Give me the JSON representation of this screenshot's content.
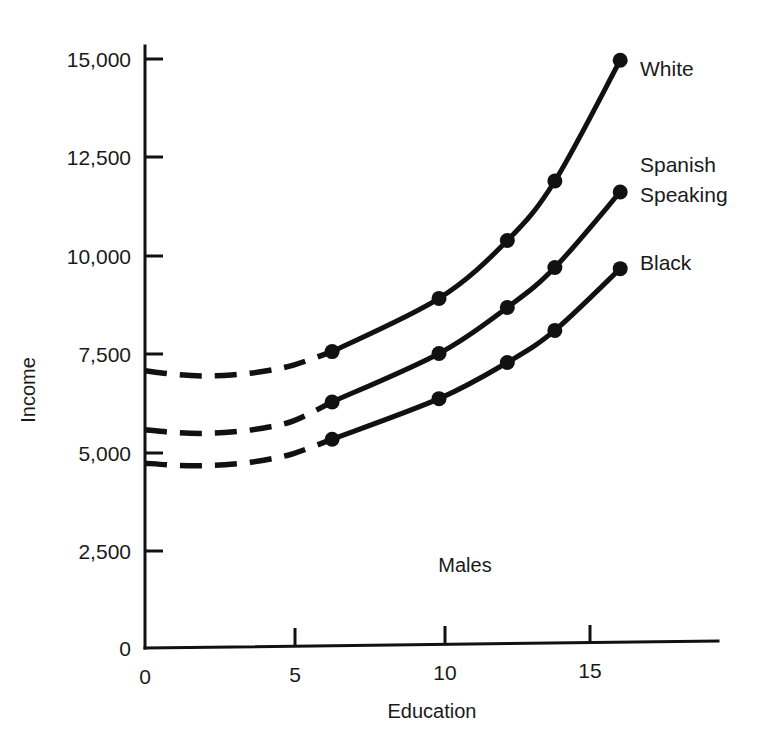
{
  "chart_data": {
    "type": "line",
    "title": "",
    "subtitle": "",
    "xlabel": "Education",
    "ylabel": "Income",
    "xlim": [
      0,
      23
    ],
    "ylim": [
      0,
      15800
    ],
    "grid": false,
    "legend_position": "right-of-line-ends",
    "annotation": "Males",
    "x_ticks": [
      "0",
      "5",
      "10",
      "15"
    ],
    "x_tick_values": [
      0,
      5,
      10,
      15
    ],
    "y_ticks": [
      "0",
      "2,500",
      "5,000",
      "7,500",
      "10,000",
      "12,500",
      "15,000"
    ],
    "y_tick_values": [
      0,
      2500,
      5000,
      7500,
      10000,
      12500,
      15000
    ],
    "origin_label": "0",
    "series": [
      {
        "name": "White",
        "label": "White",
        "color": "#111111",
        "extrapolated_x": [
          0,
          1,
          2,
          3,
          4,
          5,
          6.3
        ],
        "extrapolated_values": [
          7050,
          6950,
          6900,
          6920,
          7000,
          7150,
          7480
        ],
        "x": [
          6.3,
          9.9,
          12.2,
          13.8,
          16.0
        ],
        "values": [
          7480,
          8800,
          10250,
          11750,
          14800
        ]
      },
      {
        "name": "Spanish Speaking",
        "label": "Spanish\nSpeaking",
        "label_line1": "Spanish",
        "label_line2": "Speaking",
        "color": "#111111",
        "extrapolated_x": [
          0,
          1,
          2,
          3,
          4,
          5,
          6.3
        ],
        "extrapolated_values": [
          5550,
          5470,
          5440,
          5470,
          5560,
          5730,
          6200
        ],
        "x": [
          6.3,
          9.9,
          12.2,
          13.8,
          16.0
        ],
        "values": [
          6200,
          7400,
          8550,
          9550,
          11450
        ]
      },
      {
        "name": "Black",
        "label": "Black",
        "color": "#111111",
        "extrapolated_x": [
          0,
          1,
          2,
          3,
          4,
          5,
          6.3
        ],
        "extrapolated_values": [
          4700,
          4640,
          4620,
          4650,
          4740,
          4900,
          5250
        ],
        "x": [
          6.3,
          9.9,
          12.2,
          13.8,
          16.0
        ],
        "values": [
          5250,
          6250,
          7150,
          7950,
          9500
        ]
      }
    ]
  },
  "axes": {
    "y_title": "Income",
    "x_title": "Education"
  },
  "annotations": {
    "group": "Males"
  },
  "labels": {
    "white": "White",
    "spanish_line1": "Spanish",
    "spanish_line2": "Speaking",
    "black": "Black"
  },
  "ticks": {
    "y": [
      "15,000",
      "12,500",
      "10,000",
      "7,500",
      "5,000",
      "2,500",
      "0"
    ],
    "x": [
      "0",
      "5",
      "10",
      "15"
    ]
  },
  "colors": {
    "ink": "#111111",
    "background": "#ffffff"
  }
}
